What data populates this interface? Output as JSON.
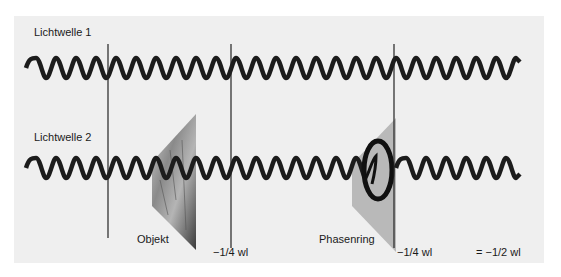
{
  "diagram": {
    "wave1_label": "Lichtwelle 1",
    "wave2_label": "Lichtwelle 2",
    "object_label": "Objekt",
    "phase_ring_label": "Phasenring",
    "shift1_label": "−1/4 wl",
    "shift2_label": "−1/4 wl",
    "total_shift_label": "= −1/2 wl"
  },
  "colors": {
    "panel": "#efefef",
    "wave": "#1c1c1c",
    "wedge_ring": "#b8b8b8"
  }
}
